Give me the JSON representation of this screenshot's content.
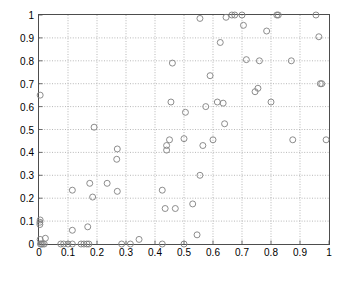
{
  "chart_data": {
    "type": "scatter",
    "title": "",
    "xlabel": "",
    "ylabel": "",
    "xlim": [
      0,
      1
    ],
    "ylim": [
      0,
      1
    ],
    "xticks": [
      0,
      0.1,
      0.2,
      0.3,
      0.4,
      0.5,
      0.6,
      0.7,
      0.8,
      0.9,
      1
    ],
    "yticks": [
      0,
      0.1,
      0.2,
      0.3,
      0.4,
      0.5,
      0.6,
      0.7,
      0.8,
      0.9,
      1
    ],
    "xtick_labels": [
      "0",
      "0.1",
      "0.2",
      "0.3",
      "0.4",
      "0.5",
      "0.6",
      "0.7",
      "0.8",
      "0.9",
      "1"
    ],
    "ytick_labels": [
      "0",
      "0.1",
      "0.2",
      "0.3",
      "0.4",
      "0.5",
      "0.6",
      "0.7",
      "0.8",
      "0.9",
      "1"
    ],
    "grid": true,
    "grid_style": "dotted",
    "grid_color": "#999999",
    "legend": null,
    "marker": "circle-open",
    "marker_color": "#808080",
    "marker_size": 5,
    "axis_color": "#4d4d4d",
    "background": "#ffffff",
    "points": [
      [
        0.005,
        0.0
      ],
      [
        0.008,
        0.0
      ],
      [
        0.012,
        0.0
      ],
      [
        0.018,
        0.0
      ],
      [
        0.004,
        0.02
      ],
      [
        0.022,
        0.025
      ],
      [
        0.003,
        0.085
      ],
      [
        0.003,
        0.095
      ],
      [
        0.004,
        0.105
      ],
      [
        0.004,
        0.65
      ],
      [
        0.075,
        0.0
      ],
      [
        0.085,
        0.0
      ],
      [
        0.1,
        0.0
      ],
      [
        0.115,
        0.0
      ],
      [
        0.115,
        0.06
      ],
      [
        0.115,
        0.235
      ],
      [
        0.145,
        0.0
      ],
      [
        0.155,
        0.0
      ],
      [
        0.165,
        0.0
      ],
      [
        0.172,
        0.0
      ],
      [
        0.168,
        0.075
      ],
      [
        0.185,
        0.205
      ],
      [
        0.19,
        0.51
      ],
      [
        0.175,
        0.265
      ],
      [
        0.235,
        0.265
      ],
      [
        0.27,
        0.23
      ],
      [
        0.27,
        0.415
      ],
      [
        0.268,
        0.37
      ],
      [
        0.285,
        0.0
      ],
      [
        0.315,
        0.0
      ],
      [
        0.345,
        0.02
      ],
      [
        0.425,
        0.0
      ],
      [
        0.425,
        0.235
      ],
      [
        0.435,
        0.155
      ],
      [
        0.44,
        0.41
      ],
      [
        0.44,
        0.43
      ],
      [
        0.45,
        0.455
      ],
      [
        0.455,
        0.62
      ],
      [
        0.46,
        0.79
      ],
      [
        0.47,
        0.155
      ],
      [
        0.5,
        0.0
      ],
      [
        0.5,
        0.46
      ],
      [
        0.505,
        0.575
      ],
      [
        0.53,
        0.175
      ],
      [
        0.545,
        0.04
      ],
      [
        0.555,
        0.3
      ],
      [
        0.555,
        0.985
      ],
      [
        0.565,
        0.43
      ],
      [
        0.575,
        0.6
      ],
      [
        0.59,
        0.735
      ],
      [
        0.6,
        0.455
      ],
      [
        0.615,
        0.62
      ],
      [
        0.625,
        0.88
      ],
      [
        0.635,
        0.615
      ],
      [
        0.64,
        0.525
      ],
      [
        0.645,
        0.99
      ],
      [
        0.665,
        1.0
      ],
      [
        0.675,
        1.0
      ],
      [
        0.7,
        1.0
      ],
      [
        0.705,
        0.955
      ],
      [
        0.715,
        0.805
      ],
      [
        0.745,
        0.665
      ],
      [
        0.755,
        0.68
      ],
      [
        0.76,
        0.8
      ],
      [
        0.785,
        0.93
      ],
      [
        0.8,
        0.62
      ],
      [
        0.82,
        1.0
      ],
      [
        0.825,
        1.0
      ],
      [
        0.87,
        0.8
      ],
      [
        0.875,
        0.455
      ],
      [
        0.955,
        1.0
      ],
      [
        0.965,
        0.905
      ],
      [
        0.97,
        0.7
      ],
      [
        0.975,
        0.7
      ],
      [
        0.99,
        0.455
      ]
    ]
  }
}
